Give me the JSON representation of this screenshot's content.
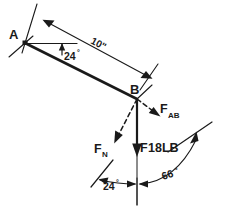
{
  "diagram": {
    "type": "engineering-free-body-diagram",
    "style": "hand-drawn pencil sketch",
    "background_color": "#ffffff",
    "ink_color": "#1a1a1a",
    "points": {
      "a_label": "A",
      "b_label": "B"
    },
    "dimensions": {
      "bar_length_label": "10\"",
      "bar_length_value": 10,
      "bar_length_units": "inches"
    },
    "angles": {
      "bar_incline_label": "24",
      "bar_incline_degree_symbol": "°",
      "bar_incline_value": 24,
      "normal_force_angle_label": "24",
      "normal_force_angle_degree_symbol": "°",
      "normal_force_angle_value": 24,
      "ab_force_angle_label": "66",
      "ab_force_angle_degree_symbol": "°",
      "ab_force_angle_value": 66
    },
    "forces": [
      {
        "id": "f-ab",
        "label_base": "F",
        "label_sub": "AB",
        "description": "axial force along member AB",
        "line_style": "dashed",
        "direction": "down-right from B"
      },
      {
        "id": "f-n",
        "label_base": "F",
        "label_sub": "N",
        "description": "normal force at B",
        "line_style": "dashed",
        "direction": "down-left from B"
      },
      {
        "id": "f-weight",
        "label_base": "F",
        "label_value": "18LB",
        "description": "applied vertical load at B",
        "line_style": "solid",
        "direction": "straight down from B"
      }
    ]
  }
}
